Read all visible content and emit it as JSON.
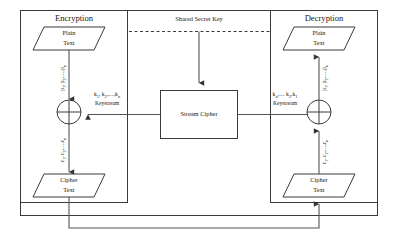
{
  "diagram": {
    "type": "block-flow-diagram",
    "colors": {
      "stroke": "#3a3a3a",
      "flow": "#555555",
      "text": "#1a1a1a",
      "background": "#ffffff"
    },
    "panels": {
      "encryption": {
        "header": "Encryption",
        "plain_text": {
          "line1": "Plain",
          "line2": "Text"
        },
        "cipher_text": {
          "line1": "Cipher",
          "line2": "Text"
        },
        "input_stream": {
          "base": "p",
          "text": "p₁, p₂,…,pₙ"
        },
        "output_stream": {
          "base": "c",
          "text": "c₁, c₂,…,cₙ"
        },
        "keystream": {
          "sequence": "k₁, k₂,…,kₙ",
          "caption": "Keystream"
        },
        "operator": "xor"
      },
      "decryption": {
        "header": "Decryption",
        "plain_text": {
          "line1": "Plain",
          "line2": "Text"
        },
        "cipher_text": {
          "line1": "Cipher",
          "line2": "Text"
        },
        "input_stream": {
          "base": "c",
          "text": "c₁, c₂,…,cₙ"
        },
        "output_stream": {
          "base": "p",
          "text": "p₁, p₂,…,pₙ"
        },
        "keystream": {
          "sequence": "kₙ,… k₂,k₁",
          "caption": "Keystream"
        },
        "operator": "xor"
      },
      "shared_key": {
        "label": "Shared Secret Key"
      },
      "stream_cipher": {
        "label": "Stream Cipher"
      }
    },
    "keystream_parts": {
      "enc": [
        {
          "main": "k",
          "sub": "1",
          "tail": ","
        },
        {
          "main": " k",
          "sub": "2",
          "tail": ",…,"
        },
        {
          "main": "k",
          "sub": "n",
          "tail": ""
        }
      ],
      "dec": [
        {
          "main": "k",
          "sub": "n",
          "tail": ",…"
        },
        {
          "main": " k",
          "sub": "2",
          "tail": ","
        },
        {
          "main": "k",
          "sub": "1",
          "tail": ""
        }
      ]
    }
  }
}
